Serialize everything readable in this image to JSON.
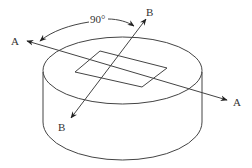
{
  "diagram": {
    "type": "cylinder-with-rotated-axes",
    "angle_label": "90°",
    "axes": [
      {
        "name": "A",
        "start_label": "A",
        "end_label": "A"
      },
      {
        "name": "B",
        "start_label": "B",
        "end_label": "B"
      }
    ],
    "colors": {
      "line": "#444444",
      "text": "#333333",
      "background": "#ffffff"
    }
  }
}
